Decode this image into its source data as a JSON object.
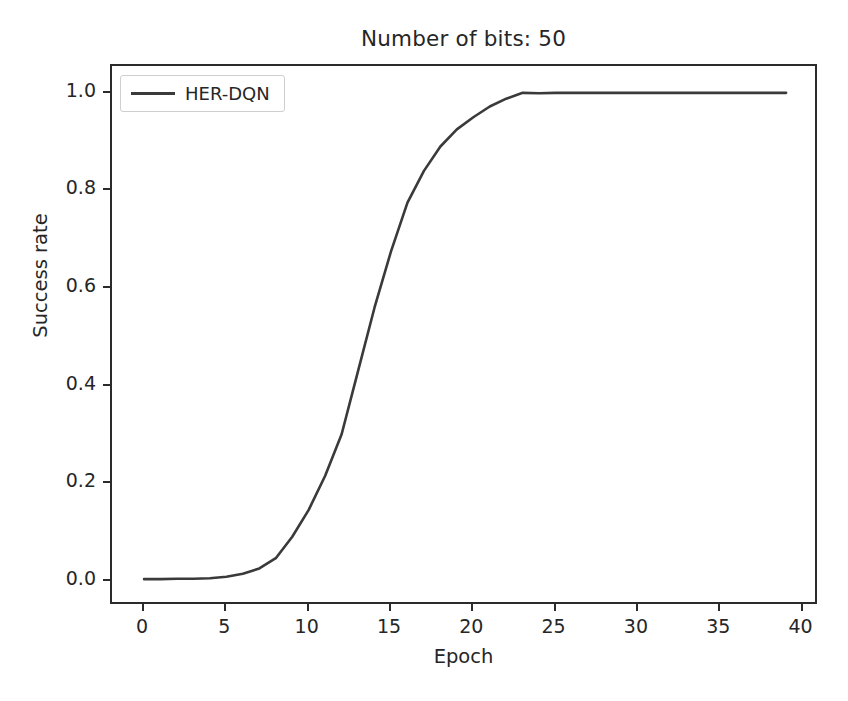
{
  "chart_data": {
    "type": "line",
    "title": "Number of bits: 50",
    "xlabel": "Epoch",
    "ylabel": "Success rate",
    "xlim": [
      -1.95,
      41.0
    ],
    "ylim": [
      -0.052,
      1.055
    ],
    "grid": false,
    "legend_position": "upper left",
    "line_color": "#3a3a3a",
    "xticks": [
      0,
      5,
      10,
      15,
      20,
      25,
      30,
      35,
      40
    ],
    "xticklabels": [
      "0",
      "5",
      "10",
      "15",
      "20",
      "25",
      "30",
      "35",
      "40"
    ],
    "yticks": [
      0.0,
      0.2,
      0.4,
      0.6,
      0.8,
      1.0
    ],
    "yticklabels": [
      "0.0",
      "0.2",
      "0.4",
      "0.6",
      "0.8",
      "1.0"
    ],
    "series": [
      {
        "name": "HER-DQN",
        "x": [
          0,
          1,
          2,
          3,
          4,
          5,
          6,
          7,
          8,
          9,
          10,
          11,
          12,
          13,
          14,
          15,
          16,
          17,
          18,
          19,
          20,
          21,
          22,
          23,
          24,
          25,
          26,
          27,
          28,
          29,
          30,
          31,
          32,
          33,
          34,
          35,
          36,
          37,
          38,
          39
        ],
        "values": [
          0.003,
          0.003,
          0.004,
          0.004,
          0.005,
          0.008,
          0.014,
          0.025,
          0.046,
          0.09,
          0.145,
          0.215,
          0.3,
          0.43,
          0.56,
          0.675,
          0.775,
          0.84,
          0.89,
          0.925,
          0.95,
          0.972,
          0.988,
          1.0,
          0.999,
          1.0,
          1.0,
          1.0,
          1.0,
          1.0,
          1.0,
          1.0,
          1.0,
          1.0,
          1.0,
          1.0,
          1.0,
          1.0,
          1.0,
          1.0
        ]
      }
    ]
  },
  "legend": {
    "entries": [
      {
        "label": "HER-DQN",
        "color": "#3a3a3a"
      }
    ]
  }
}
